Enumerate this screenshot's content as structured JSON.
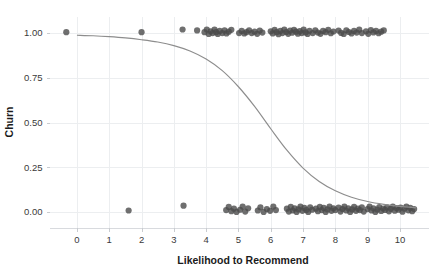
{
  "chart_data": {
    "type": "scatter",
    "title": "",
    "subtitle": "",
    "xlabel": "Likelihood to Recommend",
    "ylabel": "Churn",
    "xlim": [
      -0.85,
      10.9
    ],
    "ylim": [
      -0.09,
      1.09
    ],
    "xticks": [
      0,
      1,
      2,
      3,
      4,
      5,
      6,
      7,
      8,
      9,
      10
    ],
    "xtick_labels": [
      "0",
      "1",
      "2",
      "3",
      "4",
      "5",
      "6",
      "7",
      "8",
      "9",
      "10"
    ],
    "yticks": [
      0.0,
      0.25,
      0.5,
      0.75,
      1.0
    ],
    "ytick_labels": [
      "0.00",
      "0.25",
      "0.50",
      "0.75",
      "1.00"
    ],
    "grid": true,
    "legend": "none",
    "marker_color": "#4b4b4b",
    "marker_opacity": 0.8,
    "marker_radius": 3.1,
    "line_color": "#8d8d8d",
    "grid_color": "#eceef0",
    "background_color": "#ffffff",
    "series": [
      {
        "name": "Churn observations (jittered)",
        "type": "scatter",
        "points": [
          [
            -0.33,
            1.005
          ],
          [
            2.0,
            1.005
          ],
          [
            3.27,
            1.02
          ],
          [
            3.72,
            1.015
          ],
          [
            3.95,
            1.005
          ],
          [
            4.02,
            1.02
          ],
          [
            4.08,
            0.995
          ],
          [
            4.14,
            1.01
          ],
          [
            4.2,
            1.0
          ],
          [
            4.26,
            1.02
          ],
          [
            4.31,
            1.005
          ],
          [
            4.36,
            0.995
          ],
          [
            4.42,
            1.012
          ],
          [
            4.5,
            1.0
          ],
          [
            4.57,
            1.015
          ],
          [
            4.63,
            0.998
          ],
          [
            4.7,
            1.008
          ],
          [
            4.78,
            1.018
          ],
          [
            5.02,
            1.0
          ],
          [
            5.1,
            1.012
          ],
          [
            5.18,
            0.998
          ],
          [
            5.25,
            1.005
          ],
          [
            5.33,
            1.016
          ],
          [
            5.41,
            1.0
          ],
          [
            5.5,
            1.008
          ],
          [
            5.58,
            0.996
          ],
          [
            5.66,
            1.014
          ],
          [
            5.74,
            1.003
          ],
          [
            6.0,
            1.01
          ],
          [
            6.06,
            0.998
          ],
          [
            6.12,
            1.018
          ],
          [
            6.18,
            1.005
          ],
          [
            6.24,
            0.994
          ],
          [
            6.3,
            1.012
          ],
          [
            6.36,
            1.0
          ],
          [
            6.42,
            1.02
          ],
          [
            6.48,
            1.006
          ],
          [
            6.54,
            0.996
          ],
          [
            6.6,
            1.014
          ],
          [
            6.66,
            1.002
          ],
          [
            6.72,
            1.018
          ],
          [
            6.78,
            1.008
          ],
          [
            6.84,
            0.997
          ],
          [
            6.9,
            1.011
          ],
          [
            6.96,
            1.0
          ],
          [
            7.02,
            1.019
          ],
          [
            7.08,
            1.004
          ],
          [
            7.14,
            0.995
          ],
          [
            7.2,
            1.013
          ],
          [
            7.3,
            1.0
          ],
          [
            7.38,
            1.016
          ],
          [
            7.46,
            1.003
          ],
          [
            7.54,
            0.996
          ],
          [
            7.62,
            1.012
          ],
          [
            7.7,
            1.005
          ],
          [
            7.78,
            1.018
          ],
          [
            7.86,
            0.999
          ],
          [
            7.94,
            1.009
          ],
          [
            8.1,
            1.014
          ],
          [
            8.18,
            1.001
          ],
          [
            8.26,
            0.995
          ],
          [
            8.34,
            1.016
          ],
          [
            8.42,
            1.006
          ],
          [
            8.5,
            0.998
          ],
          [
            8.58,
            1.012
          ],
          [
            8.66,
            1.003
          ],
          [
            8.74,
            1.019
          ],
          [
            8.82,
            1.0
          ],
          [
            8.95,
            1.01
          ],
          [
            9.02,
            0.996
          ],
          [
            9.1,
            1.017
          ],
          [
            9.18,
            1.004
          ],
          [
            9.26,
            1.012
          ],
          [
            9.34,
            0.999
          ],
          [
            9.42,
            1.008
          ],
          [
            9.5,
            1.015
          ],
          [
            1.6,
            0.008
          ],
          [
            3.3,
            0.035
          ],
          [
            4.62,
            0.01
          ],
          [
            4.7,
            0.028
          ],
          [
            4.78,
            0.004
          ],
          [
            4.86,
            0.018
          ],
          [
            4.94,
            0.0
          ],
          [
            5.05,
            0.012
          ],
          [
            5.13,
            0.03
          ],
          [
            5.21,
            0.002
          ],
          [
            5.3,
            0.02
          ],
          [
            5.6,
            0.008
          ],
          [
            5.68,
            0.026
          ],
          [
            5.78,
            0.0
          ],
          [
            5.88,
            0.016
          ],
          [
            5.98,
            0.006
          ],
          [
            6.08,
            0.03
          ],
          [
            6.16,
            0.01
          ],
          [
            6.5,
            0.018
          ],
          [
            6.56,
            0.002
          ],
          [
            6.62,
            0.028
          ],
          [
            6.68,
            0.008
          ],
          [
            6.74,
            0.02
          ],
          [
            6.8,
            0.0
          ],
          [
            6.86,
            0.014
          ],
          [
            6.92,
            0.03
          ],
          [
            6.98,
            0.006
          ],
          [
            7.04,
            0.022
          ],
          [
            7.1,
            0.01
          ],
          [
            7.16,
            0.0
          ],
          [
            7.22,
            0.026
          ],
          [
            7.28,
            0.012
          ],
          [
            7.4,
            0.018
          ],
          [
            7.46,
            0.004
          ],
          [
            7.52,
            0.028
          ],
          [
            7.58,
            0.01
          ],
          [
            7.64,
            0.022
          ],
          [
            7.7,
            0.0
          ],
          [
            7.76,
            0.014
          ],
          [
            7.82,
            0.03
          ],
          [
            7.88,
            0.006
          ],
          [
            7.94,
            0.02
          ],
          [
            8.0,
            0.01
          ],
          [
            8.1,
            0.024
          ],
          [
            8.16,
            0.002
          ],
          [
            8.22,
            0.016
          ],
          [
            8.28,
            0.03
          ],
          [
            8.34,
            0.008
          ],
          [
            8.4,
            0.02
          ],
          [
            8.46,
            0.0
          ],
          [
            8.52,
            0.014
          ],
          [
            8.58,
            0.028
          ],
          [
            8.64,
            0.006
          ],
          [
            8.7,
            0.018
          ],
          [
            8.76,
            0.01
          ],
          [
            8.82,
            0.026
          ],
          [
            8.88,
            0.002
          ],
          [
            9.0,
            0.016
          ],
          [
            9.06,
            0.03
          ],
          [
            9.12,
            0.008
          ],
          [
            9.18,
            0.02
          ],
          [
            9.24,
            0.0
          ],
          [
            9.3,
            0.013
          ],
          [
            9.36,
            0.027
          ],
          [
            9.42,
            0.005
          ],
          [
            9.48,
            0.019
          ],
          [
            9.54,
            0.011
          ],
          [
            9.6,
            0.025
          ],
          [
            9.66,
            0.003
          ],
          [
            9.72,
            0.017
          ],
          [
            9.78,
            0.029
          ],
          [
            9.84,
            0.007
          ],
          [
            9.9,
            0.021
          ],
          [
            9.96,
            0.012
          ],
          [
            10.02,
            0.024
          ],
          [
            10.08,
            0.001
          ],
          [
            10.14,
            0.018
          ],
          [
            10.2,
            0.03
          ],
          [
            10.26,
            0.009
          ],
          [
            10.32,
            0.022
          ],
          [
            10.38,
            0.004
          ],
          [
            10.44,
            0.016
          ]
        ]
      },
      {
        "name": "Logistic fit",
        "type": "line",
        "x": [
          0.0,
          0.5,
          1.0,
          1.5,
          2.0,
          2.5,
          3.0,
          3.5,
          4.0,
          4.5,
          5.0,
          5.5,
          6.0,
          6.5,
          7.0,
          7.5,
          8.0,
          8.5,
          9.0,
          9.5,
          10.0,
          10.5
        ],
        "y": [
          0.988,
          0.985,
          0.98,
          0.973,
          0.963,
          0.95,
          0.93,
          0.9,
          0.855,
          0.79,
          0.7,
          0.59,
          0.465,
          0.345,
          0.245,
          0.17,
          0.118,
          0.082,
          0.058,
          0.042,
          0.031,
          0.023
        ]
      }
    ]
  }
}
